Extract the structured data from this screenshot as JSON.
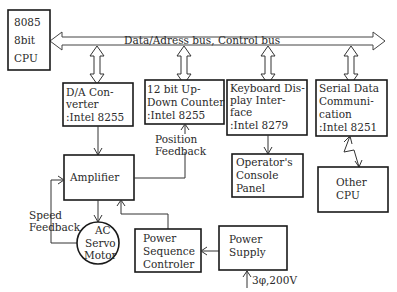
{
  "diagram": {
    "bus_label": "Data/Adress bus, Control bus",
    "blocks": {
      "cpu": [
        "8085",
        "8bit",
        "CPU"
      ],
      "da_converter": [
        "D/A Con-",
        "verter",
        ":Intel 8255"
      ],
      "counter": [
        "12 bit Up-",
        "Down Counter",
        ":Intel 8255"
      ],
      "keyboard": [
        "Keyboard Dis-",
        "play Inter-",
        "face",
        ":Intel 8279"
      ],
      "serial": [
        "Serial Data",
        "Communi-",
        "cation",
        ":Intel 8251"
      ],
      "amplifier": [
        "Amplifier"
      ],
      "operator_console": [
        "Operator's",
        "Console",
        "Panel"
      ],
      "other_cpu": [
        "Other",
        "CPU"
      ],
      "motor": [
        "AC",
        "Servo",
        "Motor"
      ],
      "power_sequence": [
        "Power",
        "Sequence",
        "Controler"
      ],
      "power_supply": [
        "Power",
        "Supply"
      ]
    },
    "labels": {
      "position_feedback": [
        "Position",
        "Feedback"
      ],
      "speed_feedback": [
        "Speed",
        "Feedback"
      ],
      "power_input": "3φ,200V"
    }
  }
}
